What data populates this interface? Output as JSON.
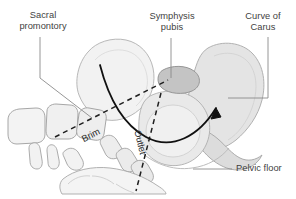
{
  "figure": {
    "background_color": "#ffffff",
    "width": 296,
    "height": 199
  },
  "labels": {
    "sacral_promontory": "Sacral\npromontory",
    "symphysis_pubis": "Symphysis\npubis",
    "curve_of_carus": "Curve of\nCarus",
    "pelvic_floor": "Pelvic floor",
    "brim": "Brim",
    "outlet": "Outlet"
  },
  "colors": {
    "text": "#3f3f3f",
    "rotated_text": "#2b2b2b",
    "leader_line": "#8a8a8a",
    "bone_outline": "#9a9a9a",
    "bone_fill_light": "#f2f2f2",
    "bone_fill_mid": "#e6e6e6",
    "bone_fill_dark": "#d6d6d6",
    "symphysis_fill": "#c9c9c9",
    "curve": "#111111",
    "dashed": "#1a1a1a"
  },
  "annotations": {
    "carus_arrow": "curve-of-carus-arrow",
    "brim_plane": "pelvic-brim-dashed-line",
    "outlet_plane": "pelvic-outlet-dashed-line"
  }
}
